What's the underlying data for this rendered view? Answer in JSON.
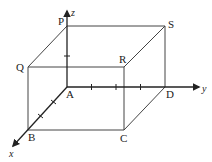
{
  "figure": {
    "colors": {
      "line": "#333333",
      "background": "#ffffff"
    }
  },
  "axes": {
    "x": {
      "label": "x"
    },
    "y": {
      "label": "y"
    },
    "z": {
      "label": "z"
    }
  },
  "vertices": {
    "A": "A",
    "B": "B",
    "C": "C",
    "D": "D",
    "P": "P",
    "Q": "Q",
    "R": "R",
    "S": "S"
  },
  "tick_marks": {
    "x_axis_count": 2,
    "y_axis_count": 3,
    "z_axis_count": 1
  }
}
